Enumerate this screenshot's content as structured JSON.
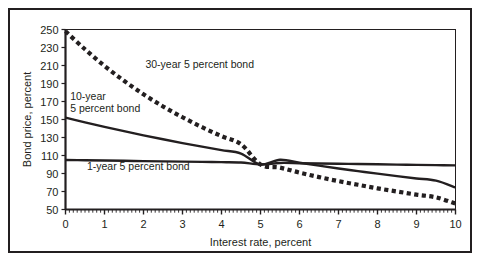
{
  "chart_data": {
    "type": "line",
    "title": "",
    "xlabel": "Interest rate, percent",
    "ylabel": "Bond price, percent",
    "xlim": [
      0,
      10
    ],
    "ylim": [
      50,
      250
    ],
    "xticks": [
      "0",
      "1",
      "2",
      "3",
      "4",
      "5",
      "6",
      "7",
      "8",
      "9",
      "10"
    ],
    "yticks": [
      "250",
      "230",
      "210",
      "190",
      "170",
      "150",
      "130",
      "110",
      "90",
      "70",
      "50"
    ],
    "x_minor_ticks_per_unit": 10,
    "grid": false,
    "legend_position": "inline-annotations",
    "x": [
      0,
      0.5,
      1,
      1.5,
      2,
      2.5,
      3,
      3.5,
      4,
      4.5,
      5,
      5.5,
      6,
      6.5,
      7,
      7.5,
      8,
      8.5,
      9,
      9.5,
      10
    ],
    "series": [
      {
        "name": "30-year 5 percent bond",
        "style": "dashed",
        "label": "30-year 5 percent bond",
        "label_x": 2.05,
        "label_y": 207,
        "values": [
          248.0,
          228.0,
          209.5,
          193.0,
          178.0,
          164.5,
          152.5,
          141.5,
          131.5,
          122.5,
          100.0,
          96.5,
          91.0,
          86.0,
          81.5,
          77.5,
          73.5,
          70.0,
          66.5,
          63.5,
          56.5
        ]
      },
      {
        "name": "10-year 5 percent bond",
        "style": "solid",
        "label_line1": "10-year",
        "label_line2": "5 percent bond",
        "label_x": 0.12,
        "label_y1": 172,
        "label_y2": 158,
        "values": [
          152.0,
          146.8,
          141.8,
          137.0,
          132.4,
          128.0,
          123.8,
          119.8,
          115.9,
          112.2,
          100.0,
          105.2,
          101.9,
          98.7,
          95.6,
          92.7,
          89.8,
          87.1,
          84.5,
          82.0,
          74.5
        ]
      },
      {
        "name": "1-year 5 percent bond",
        "style": "solid",
        "label": "1-year 5 percent bond",
        "label_x": 0.55,
        "label_y": 94,
        "values": [
          105.0,
          104.7,
          104.4,
          104.1,
          103.8,
          103.5,
          103.2,
          102.9,
          102.6,
          102.3,
          100.0,
          101.7,
          101.4,
          101.1,
          100.8,
          100.5,
          100.2,
          99.9,
          99.6,
          99.3,
          99.0
        ]
      }
    ],
    "colors": {
      "line": "#231f20",
      "frame": "#231f20",
      "background": "#ffffff"
    }
  }
}
